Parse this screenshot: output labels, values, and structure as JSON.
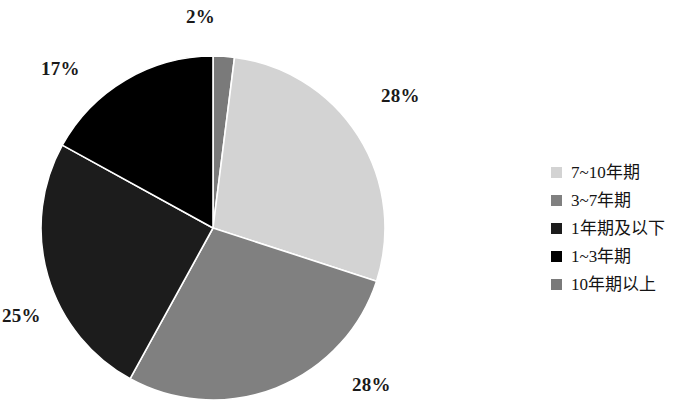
{
  "chart_data": {
    "type": "pie",
    "title": "",
    "subtitle": "",
    "xlabel": "",
    "ylabel": "",
    "grid": false,
    "legend_position": "right",
    "start_angle_deg": 0,
    "direction": "clockwise",
    "categories": [
      "10年期以上",
      "7~10年期",
      "3~7年期",
      "1年期及以下",
      "1~3年期"
    ],
    "values": [
      2,
      28,
      28,
      25,
      17
    ],
    "value_labels": [
      "2%",
      "28%",
      "28%",
      "25%",
      "17%"
    ],
    "colors": [
      "#7a7a7a",
      "#d3d3d3",
      "#808080",
      "#1c1c1c",
      "#000000"
    ],
    "slices": [
      {
        "label": "2%",
        "value": 2,
        "category": "10年期以上",
        "color": "#7a7a7a"
      },
      {
        "label": "28%",
        "value": 28,
        "category": "7~10年期",
        "color": "#d3d3d3"
      },
      {
        "label": "28%",
        "value": 28,
        "category": "3~7年期",
        "color": "#808080"
      },
      {
        "label": "25%",
        "value": 25,
        "category": "1年期及以下",
        "color": "#1c1c1c"
      },
      {
        "label": "17%",
        "value": 17,
        "category": "1~3年期",
        "color": "#000000"
      }
    ]
  },
  "legend": {
    "items": [
      {
        "label": "7~10年期",
        "color": "#d3d3d3"
      },
      {
        "label": "3~7年期",
        "color": "#808080"
      },
      {
        "label": "1年期及以下",
        "color": "#1c1c1c"
      },
      {
        "label": "1~3年期",
        "color": "#000000"
      },
      {
        "label": "10年期以上",
        "color": "#7a7a7a"
      }
    ]
  }
}
